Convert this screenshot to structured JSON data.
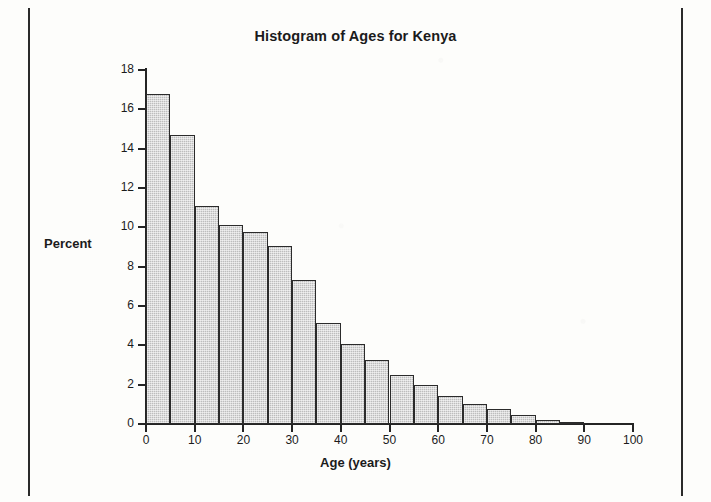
{
  "frame": {
    "left_rule": "page-edge-rule",
    "right_rule": "page-edge-rule"
  },
  "chart_data": {
    "type": "bar",
    "title": "Histogram of Ages for Kenya",
    "xlabel": "Age (years)",
    "ylabel": "Percent",
    "grid": false,
    "legend": "none",
    "xlim": [
      0,
      100
    ],
    "ylim": [
      0,
      18
    ],
    "bin_width": 5,
    "x_ticks": [
      0,
      10,
      20,
      30,
      40,
      50,
      60,
      70,
      80,
      90,
      100
    ],
    "x_tick_labels": [
      "0",
      "10",
      "20",
      "30",
      "40",
      "50",
      "60",
      "70",
      "80",
      "90",
      "100"
    ],
    "y_ticks": [
      0,
      2,
      4,
      6,
      8,
      10,
      12,
      14,
      16,
      18
    ],
    "y_tick_labels": [
      "0",
      "2",
      "4",
      "6",
      "8",
      "10",
      "12",
      "14",
      "16",
      "18"
    ],
    "bin_starts": [
      0,
      5,
      10,
      15,
      20,
      25,
      30,
      35,
      40,
      45,
      50,
      55,
      60,
      65,
      70,
      75,
      80,
      85
    ],
    "bin_ends": [
      5,
      10,
      15,
      20,
      25,
      30,
      35,
      40,
      45,
      50,
      55,
      60,
      65,
      70,
      75,
      80,
      85,
      90
    ],
    "categories": [
      "0-5",
      "5-10",
      "10-15",
      "15-20",
      "20-25",
      "25-30",
      "30-35",
      "35-40",
      "40-45",
      "45-50",
      "50-55",
      "55-60",
      "60-65",
      "65-70",
      "70-75",
      "75-80",
      "80-85",
      "85-90"
    ],
    "values": [
      16.8,
      14.7,
      11.1,
      10.1,
      9.75,
      9.05,
      7.3,
      5.15,
      4.05,
      3.25,
      2.5,
      2.0,
      1.4,
      1.0,
      0.75,
      0.45,
      0.2,
      0.1
    ],
    "bar_fill_color": "#bdbdbd",
    "bar_edge_color": "#2b2b2b",
    "axis_color": "#242424",
    "text_color": "#1b1b1b"
  }
}
